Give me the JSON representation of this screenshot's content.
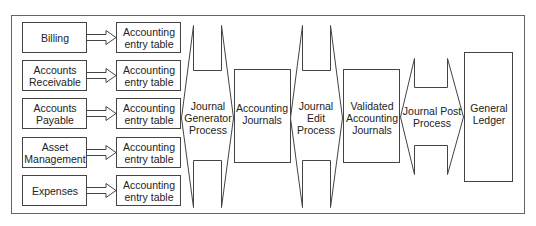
{
  "diagram": {
    "colors": {
      "stroke": "#444444",
      "frame": "#666666",
      "background": "#ffffff",
      "text": "#222222"
    },
    "sources": [
      {
        "label": "Billing"
      },
      {
        "label": "Accounts Receivable"
      },
      {
        "label": "Accounts Payable"
      },
      {
        "label": "Asset Management"
      },
      {
        "label": "Expenses"
      }
    ],
    "entry_tables": [
      {
        "label": "Accounting entry table"
      },
      {
        "label": "Accounting entry table"
      },
      {
        "label": "Accounting entry table"
      },
      {
        "label": "Accounting entry table"
      },
      {
        "label": "Accounting entry table"
      }
    ],
    "processes": [
      {
        "label": "Journal Generator Process"
      },
      {
        "label": "Journal Edit Process"
      },
      {
        "label": "Journal Post Process"
      }
    ],
    "stores": [
      {
        "label": "Accounting Journals"
      },
      {
        "label": "Validated Accounting Journals"
      },
      {
        "label": "General Ledger"
      }
    ]
  }
}
